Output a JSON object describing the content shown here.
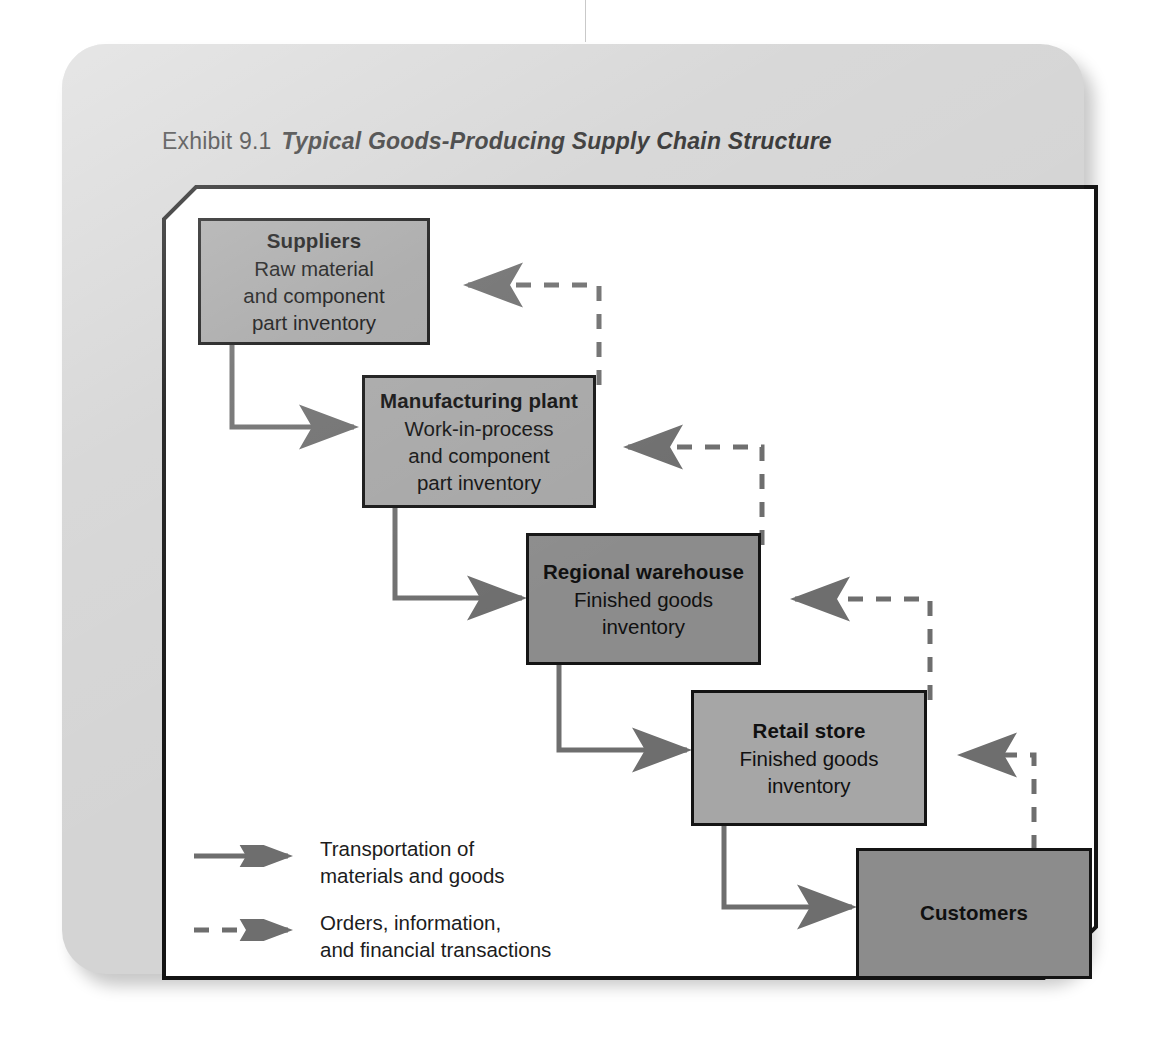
{
  "exhibit": {
    "label": "Exhibit 9.1",
    "title": "Typical Goods-Producing Supply Chain Structure"
  },
  "colors": {
    "card_background": "#d4d4d4",
    "panel_background": "#ffffff",
    "node_light_fill": "#a6a6a6",
    "node_dark_fill": "#8c8c8c",
    "node_border": "#141414",
    "connector": "#6e6e6e",
    "text": "#101010"
  },
  "nodes": [
    {
      "id": "suppliers",
      "title": "Suppliers",
      "lines": [
        "Raw material",
        "and component",
        "part inventory"
      ],
      "shade": "light"
    },
    {
      "id": "manufacturing-plant",
      "title": "Manufacturing plant",
      "lines": [
        "Work-in-process",
        "and component",
        "part inventory"
      ],
      "shade": "light"
    },
    {
      "id": "regional-warehouse",
      "title": "Regional warehouse",
      "lines": [
        "Finished goods",
        "inventory"
      ],
      "shade": "dark"
    },
    {
      "id": "retail-store",
      "title": "Retail store",
      "lines": [
        "Finished goods",
        "inventory"
      ],
      "shade": "light"
    },
    {
      "id": "customers",
      "title": "Customers",
      "lines": [],
      "shade": "dark"
    }
  ],
  "flows": {
    "downstream": [
      {
        "from": "suppliers",
        "to": "manufacturing-plant",
        "style": "solid",
        "direction": "right"
      },
      {
        "from": "manufacturing-plant",
        "to": "regional-warehouse",
        "style": "solid",
        "direction": "right"
      },
      {
        "from": "regional-warehouse",
        "to": "retail-store",
        "style": "solid",
        "direction": "right"
      },
      {
        "from": "retail-store",
        "to": "customers",
        "style": "solid",
        "direction": "right"
      }
    ],
    "upstream": [
      {
        "from": "manufacturing-plant",
        "to": "suppliers",
        "style": "dashed",
        "direction": "left"
      },
      {
        "from": "regional-warehouse",
        "to": "manufacturing-plant",
        "style": "dashed",
        "direction": "left"
      },
      {
        "from": "retail-store",
        "to": "regional-warehouse",
        "style": "dashed",
        "direction": "left"
      },
      {
        "from": "customers",
        "to": "retail-store",
        "style": "dashed",
        "direction": "left"
      }
    ]
  },
  "legend": [
    {
      "id": "transportation",
      "style": "solid",
      "lines": [
        "Transportation of",
        "materials and goods"
      ]
    },
    {
      "id": "orders-information",
      "style": "dashed",
      "lines": [
        "Orders, information,",
        "and financial transactions"
      ]
    }
  ]
}
